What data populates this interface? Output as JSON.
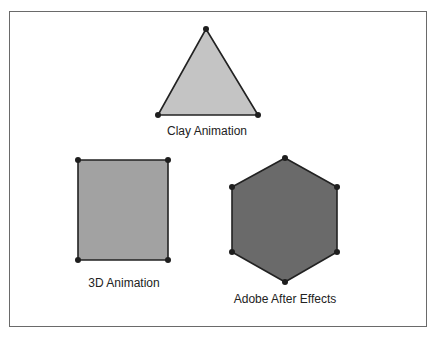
{
  "shapes": [
    {
      "name": "triangle",
      "label": "Clay Animation",
      "fill": "#c4c4c4",
      "points": [
        [
          206,
          29
        ],
        [
          258,
          115
        ],
        [
          158,
          115
        ]
      ],
      "label_pos": [
        207,
        124
      ]
    },
    {
      "name": "rectangle",
      "label": "3D Animation",
      "fill": "#a2a2a2",
      "points": [
        [
          78,
          160
        ],
        [
          168,
          160
        ],
        [
          168,
          260
        ],
        [
          78,
          260
        ]
      ],
      "label_pos": [
        124,
        276
      ]
    },
    {
      "name": "hexagon",
      "label": "Adobe After Effects",
      "fill": "#6a6a6a",
      "points": [
        [
          285,
          158
        ],
        [
          337,
          187
        ],
        [
          337,
          252
        ],
        [
          285,
          282
        ],
        [
          232,
          252
        ],
        [
          232,
          187
        ]
      ],
      "label_pos": [
        285,
        292
      ]
    }
  ],
  "colors": {
    "stroke": "#222222",
    "vertex": "#1e1e1e",
    "frame": "#6a6a6a"
  }
}
